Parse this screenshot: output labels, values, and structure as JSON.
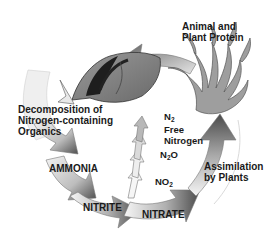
{
  "diagram": {
    "type": "cycle",
    "labels": {
      "protein": "Animal and Plant Protein",
      "protein_l1": "Animal and",
      "protein_l2": "Plant Protein",
      "decomp_l1": "Decomposition of",
      "decomp_l2": "Nitrogen-containing",
      "decomp_l3": "Organics",
      "ammonia": "AMMONIA",
      "nitrite": "NITRITE",
      "nitrate": "NITRATE",
      "assim_l1": "Assimilation",
      "assim_l2": "by Plants",
      "n2_base": "N",
      "n2_sub": "2",
      "free_l1": "Free",
      "free_l2": "Nitrogen",
      "n2o_a": "N",
      "n2o_sub": "2",
      "n2o_b": "O",
      "no2_a": "NO",
      "no2_sub": "2"
    },
    "nodes": [
      "Animal and Plant Protein",
      "Decomposition of Nitrogen-containing Organics",
      "AMMONIA",
      "NITRITE",
      "NITRATE",
      "Assimilation by Plants"
    ],
    "side_branch": [
      "NO2",
      "N2O",
      "N2 (Free Nitrogen)"
    ],
    "illustrations": [
      "fish-illustration",
      "seaweed-plant-illustration"
    ],
    "colors": {
      "arrow_dark": "#5a5a5a",
      "arrow_light": "#f2f2f2",
      "text": "#1a1a1a"
    }
  }
}
